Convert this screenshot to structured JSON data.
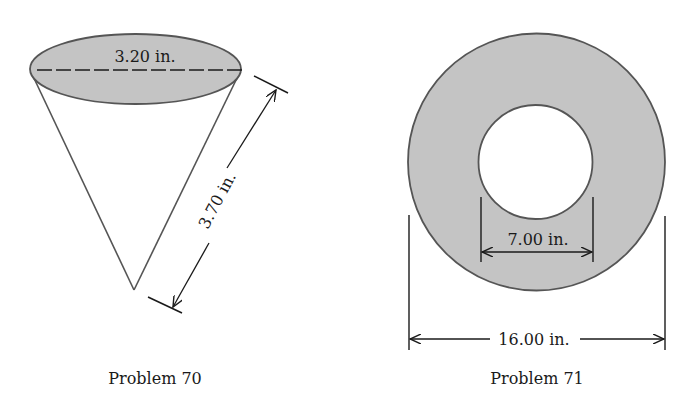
{
  "figures": [
    {
      "id": "problem-70",
      "shape": "cone",
      "caption": "Problem 70",
      "dimensions": {
        "diameter_label": "3.20 in.",
        "slant_height_label": "3.70 in."
      }
    },
    {
      "id": "problem-71",
      "shape": "annulus",
      "caption": "Problem 71",
      "dimensions": {
        "inner_diameter_label": "7.00 in.",
        "outer_diameter_label": "16.00 in."
      }
    }
  ],
  "colors": {
    "fill_gray": "#c4c4c4",
    "stroke": "#3a3a3a",
    "background": "#ffffff"
  }
}
